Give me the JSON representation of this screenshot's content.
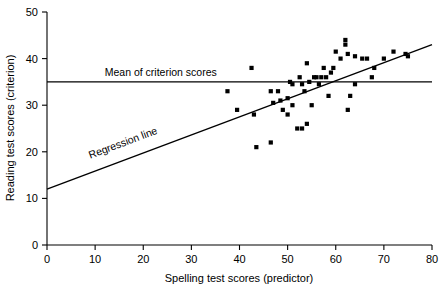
{
  "chart_data": {
    "type": "scatter",
    "title": "",
    "xlabel": "Spelling test scores (predictor)",
    "ylabel": "Reading test scores (criterion)",
    "xlim": [
      0,
      80
    ],
    "ylim": [
      0,
      50
    ],
    "xticks": [
      0,
      10,
      20,
      30,
      40,
      50,
      60,
      70,
      80
    ],
    "yticks": [
      0,
      10,
      20,
      30,
      40,
      50
    ],
    "grid": false,
    "legend": "none",
    "marker": "square",
    "marker_color": "#000000",
    "series": [
      {
        "name": "Spelling vs Reading scores",
        "type": "scatter",
        "points": [
          [
            37.5,
            33
          ],
          [
            39.5,
            29
          ],
          [
            42.5,
            38
          ],
          [
            43.0,
            28
          ],
          [
            43.5,
            21
          ],
          [
            46.5,
            22
          ],
          [
            46.5,
            33
          ],
          [
            47.0,
            30.5
          ],
          [
            48.0,
            33
          ],
          [
            48.5,
            31
          ],
          [
            49.0,
            29
          ],
          [
            50.0,
            31.5
          ],
          [
            50.0,
            28
          ],
          [
            50.5,
            35
          ],
          [
            51.0,
            34.5
          ],
          [
            51.0,
            30
          ],
          [
            52.0,
            25
          ],
          [
            52.5,
            36
          ],
          [
            53.0,
            25
          ],
          [
            53.0,
            34.5
          ],
          [
            53.5,
            33
          ],
          [
            54.0,
            39
          ],
          [
            54.0,
            26
          ],
          [
            54.5,
            35
          ],
          [
            55.0,
            30
          ],
          [
            55.5,
            36
          ],
          [
            56.0,
            36
          ],
          [
            56.5,
            34.5
          ],
          [
            57.0,
            36
          ],
          [
            57.5,
            38
          ],
          [
            58.0,
            36
          ],
          [
            58.5,
            32
          ],
          [
            59.0,
            37
          ],
          [
            59.5,
            38
          ],
          [
            60.0,
            41.5
          ],
          [
            61.0,
            40
          ],
          [
            62.0,
            44
          ],
          [
            62.0,
            43
          ],
          [
            62.5,
            41
          ],
          [
            62.5,
            29
          ],
          [
            63.0,
            32
          ],
          [
            64.0,
            40.5
          ],
          [
            64.0,
            34.5
          ],
          [
            65.5,
            40
          ],
          [
            66.5,
            40
          ],
          [
            67.5,
            36
          ],
          [
            68.0,
            38
          ],
          [
            70.0,
            40
          ],
          [
            72.0,
            41.5
          ],
          [
            74.5,
            41
          ],
          [
            75.0,
            40.5
          ]
        ]
      },
      {
        "name": "Regression line",
        "type": "line",
        "points": [
          [
            0,
            12
          ],
          [
            80,
            43
          ]
        ]
      },
      {
        "name": "Mean of criterion scores",
        "type": "line",
        "points": [
          [
            0,
            35
          ],
          [
            80,
            35
          ]
        ]
      }
    ],
    "annotations": [
      {
        "id": "mean-line-label",
        "text": "Mean of criterion scores",
        "x": 12,
        "y": 36.3
      },
      {
        "id": "regression-line-label",
        "text": "Regression line",
        "x": 9,
        "y": 18.5
      }
    ]
  }
}
